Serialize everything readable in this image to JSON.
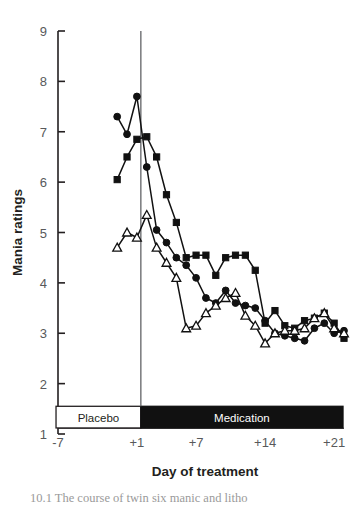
{
  "figure": {
    "background": "#ffffff",
    "caption_partial": "10.1   The  course  of  twin  six  manic  and  litho"
  },
  "chart_data": {
    "type": "line",
    "title": "",
    "xlabel": "Day of treatment",
    "ylabel": "Mania ratings",
    "xlim": [
      -7,
      22
    ],
    "ylim": [
      1,
      9
    ],
    "x_tick_labels": [
      "-7",
      "+1",
      "+7",
      "+14",
      "+21"
    ],
    "x_tick_values": [
      -7,
      1,
      7,
      14,
      21
    ],
    "y_tick_labels": [
      "1",
      "2",
      "3",
      "4",
      "5",
      "6",
      "7",
      "8",
      "9"
    ],
    "y_tick_values": [
      1,
      2,
      3,
      4,
      5,
      6,
      7,
      8,
      9
    ],
    "grid": false,
    "legend_position": "none",
    "minor_x_ticks_step": 1,
    "vertical_reference_line": {
      "x": 1.4,
      "color": "#6d6e71",
      "label": "treatment start"
    },
    "annotation_bands": [
      {
        "label": "Placebo",
        "x_start": -7.2,
        "x_end": 1.4,
        "fill": "#ffffff",
        "stroke": "#231f20",
        "text_color": "#231f20"
      },
      {
        "label": "Medication",
        "x_start": 1.4,
        "x_end": 21.9,
        "fill": "#111111",
        "stroke": "#111111",
        "text_color": "#ffffff"
      }
    ],
    "series": [
      {
        "name": "Twin A (filled circle)",
        "marker": "filled-circle",
        "color": "#111111",
        "x": [
          -1,
          0,
          1,
          2,
          3,
          4,
          5,
          6,
          7,
          8,
          9,
          10,
          11,
          12,
          13,
          14,
          15,
          16,
          17,
          18,
          19,
          20,
          21,
          22
        ],
        "y": [
          7.3,
          6.95,
          7.7,
          6.3,
          5.05,
          4.8,
          4.5,
          4.35,
          4.1,
          3.7,
          3.6,
          3.85,
          3.6,
          3.55,
          3.5,
          3.25,
          3.0,
          2.95,
          2.9,
          2.85,
          3.1,
          3.2,
          3.0,
          3.05
        ]
      },
      {
        "name": "Twin B (filled square)",
        "marker": "filled-square",
        "color": "#111111",
        "x": [
          -1,
          0,
          1,
          2,
          3,
          4,
          5,
          6,
          7,
          8,
          9,
          10,
          11,
          12,
          13,
          14,
          15,
          16,
          17,
          18,
          19,
          20,
          21,
          22
        ],
        "y": [
          6.05,
          6.5,
          6.85,
          6.9,
          6.5,
          5.75,
          5.2,
          4.5,
          4.55,
          4.55,
          4.15,
          4.5,
          4.55,
          4.55,
          4.25,
          3.2,
          3.45,
          3.15,
          3.1,
          3.25,
          3.3,
          3.4,
          3.2,
          2.9
        ]
      },
      {
        "name": "Twin C (open triangle)",
        "marker": "open-triangle",
        "color": "#111111",
        "x": [
          -1,
          0,
          1,
          2,
          3,
          4,
          5,
          6,
          7,
          8,
          9,
          10,
          11,
          12,
          13,
          14,
          15,
          16,
          17,
          18,
          19,
          20,
          21,
          22
        ],
        "y": [
          4.7,
          5.0,
          4.9,
          5.35,
          4.7,
          4.4,
          4.1,
          3.1,
          3.15,
          3.4,
          3.55,
          3.7,
          3.8,
          3.35,
          3.15,
          2.8,
          3.0,
          3.05,
          3.05,
          3.1,
          3.3,
          3.4,
          3.1,
          3.0
        ]
      }
    ]
  }
}
